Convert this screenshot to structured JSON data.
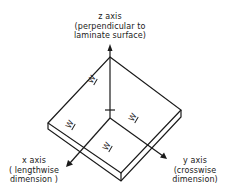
{
  "diagram": {
    "z_axis": {
      "name": "z axis",
      "description_line1": "(perpendicular to",
      "description_line2": "laminate surface)"
    },
    "x_axis": {
      "name": "x axis",
      "description_line1": "( lengthwise",
      "description_line2": "dimension )"
    },
    "y_axis": {
      "name": "y axis",
      "description_line1": "(crosswise",
      "description_line2": "dimension)"
    },
    "face_labels": [
      "W",
      "W",
      "W",
      "W"
    ],
    "colors": {
      "line": "#1a1a1a",
      "background": "#ffffff"
    }
  }
}
